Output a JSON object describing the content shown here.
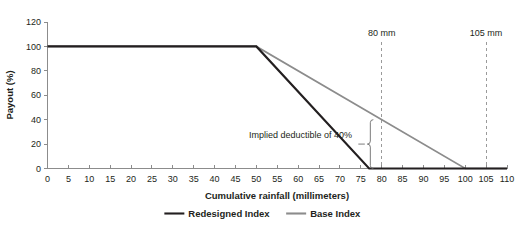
{
  "chart_data": {
    "type": "line",
    "title": "",
    "xlabel": "Cumulative rainfall (millimeters)",
    "ylabel": "Payout (%)",
    "xlim": [
      0,
      110
    ],
    "ylim": [
      0,
      120
    ],
    "xticks": [
      0,
      5,
      10,
      15,
      20,
      25,
      30,
      35,
      40,
      45,
      50,
      55,
      60,
      65,
      70,
      75,
      80,
      85,
      90,
      95,
      100,
      105,
      110
    ],
    "yticks": [
      0,
      20,
      40,
      60,
      80,
      100,
      120
    ],
    "grid": false,
    "legend_position": "bottom-center",
    "series": [
      {
        "name": "Redesigned Index",
        "color": "#231f20",
        "x": [
          0,
          50,
          77,
          110
        ],
        "y": [
          100,
          100,
          0,
          0
        ]
      },
      {
        "name": "Base Index",
        "color": "#8c8c8c",
        "x": [
          0,
          50,
          100,
          110
        ],
        "y": [
          100,
          100,
          0,
          0
        ]
      }
    ],
    "markers": [
      {
        "label": "80 mm",
        "x": 80
      },
      {
        "label": "105 mm",
        "x": 105
      }
    ],
    "annotations": [
      {
        "text": "Implied deductible of 40%",
        "x": 78,
        "y": 40,
        "bracket_from": 0,
        "bracket_to": 40
      }
    ]
  },
  "legend": {
    "items": [
      {
        "label": "Redesigned Index",
        "color": "#231f20"
      },
      {
        "label": "Base Index",
        "color": "#8c8c8c"
      }
    ]
  },
  "axes": {
    "x_title": "Cumulative rainfall (millimeters)",
    "y_title": "Payout (%)",
    "x_tick_labels": [
      "0",
      "5",
      "10",
      "15",
      "20",
      "25",
      "30",
      "35",
      "40",
      "45",
      "50",
      "55",
      "60",
      "65",
      "70",
      "75",
      "80",
      "85",
      "90",
      "95",
      "100",
      "105",
      "110"
    ],
    "y_tick_labels": [
      "0",
      "20",
      "40",
      "60",
      "80",
      "100",
      "120"
    ]
  },
  "markers": {
    "first": "80 mm",
    "second": "105 mm"
  },
  "annotation": {
    "deductible_text": "Implied deductible of 40%"
  }
}
